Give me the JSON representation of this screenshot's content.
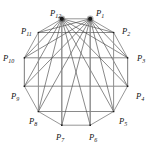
{
  "figure": {
    "shape": "regular dodecagon inscribed in circle",
    "background_color": "#ffffff",
    "edge_color": "#8a8a8a",
    "chord_color": "#4a4a4a",
    "vertex_color": "#1a1a1a",
    "label_color": "#111111"
  },
  "chart_data": {
    "type": "scatter",
    "title": "",
    "xlabel": "",
    "ylabel": "",
    "grid": false,
    "legend": null,
    "geometry": {
      "center_x": 76,
      "center_y": 72,
      "radius": 55,
      "n_vertices": 12,
      "start_angle_deg": -75,
      "angle_step_deg": 30,
      "direction": "clockwise"
    },
    "categories": [
      "P1",
      "P2",
      "P3",
      "P4",
      "P5",
      "P6",
      "P7",
      "P8",
      "P9",
      "P10",
      "P11",
      "P12"
    ],
    "points": [
      {
        "name": "P1",
        "sub": "1",
        "x": 90.2,
        "y": 18.8,
        "label_x": 96,
        "label_y": 16,
        "highlight": true
      },
      {
        "name": "P2",
        "sub": "2",
        "x": 113.6,
        "y": 32.5,
        "label_x": 122,
        "label_y": 34,
        "highlight": false
      },
      {
        "name": "P3",
        "sub": "3",
        "x": 127.6,
        "y": 57.8,
        "label_x": 137,
        "label_y": 61,
        "highlight": false
      },
      {
        "name": "P4",
        "sub": "4",
        "x": 127.6,
        "y": 86.2,
        "label_x": 136,
        "label_y": 99,
        "highlight": false
      },
      {
        "name": "P5",
        "sub": "5",
        "x": 113.6,
        "y": 111.5,
        "label_x": 119,
        "label_y": 124,
        "highlight": false
      },
      {
        "name": "P6",
        "sub": "6",
        "x": 90.2,
        "y": 125.2,
        "label_x": 89,
        "label_y": 140,
        "highlight": false
      },
      {
        "name": "P7",
        "sub": "7",
        "x": 61.8,
        "y": 125.2,
        "label_x": 56,
        "label_y": 140,
        "highlight": false
      },
      {
        "name": "P8",
        "sub": "8",
        "x": 38.4,
        "y": 111.5,
        "label_x": 29,
        "label_y": 124,
        "highlight": false
      },
      {
        "name": "P9",
        "sub": "9",
        "x": 24.4,
        "y": 86.2,
        "label_x": 11,
        "label_y": 99,
        "highlight": false
      },
      {
        "name": "P10",
        "sub": "10",
        "x": 24.4,
        "y": 57.8,
        "label_x": 3,
        "label_y": 61,
        "highlight": false
      },
      {
        "name": "P11",
        "sub": "11",
        "x": 38.4,
        "y": 32.5,
        "label_x": 21,
        "label_y": 34,
        "highlight": false
      },
      {
        "name": "P12",
        "sub": "12",
        "x": 61.8,
        "y": 18.8,
        "label_x": 50,
        "label_y": 16,
        "highlight": true
      }
    ],
    "edges": [
      [
        "P1",
        "P2"
      ],
      [
        "P2",
        "P3"
      ],
      [
        "P3",
        "P4"
      ],
      [
        "P4",
        "P5"
      ],
      [
        "P5",
        "P6"
      ],
      [
        "P6",
        "P7"
      ],
      [
        "P7",
        "P8"
      ],
      [
        "P8",
        "P9"
      ],
      [
        "P9",
        "P10"
      ],
      [
        "P10",
        "P11"
      ],
      [
        "P11",
        "P12"
      ],
      [
        "P12",
        "P1"
      ]
    ],
    "chords": [
      [
        "P1",
        "P3"
      ],
      [
        "P1",
        "P4"
      ],
      [
        "P1",
        "P5"
      ],
      [
        "P1",
        "P6"
      ],
      [
        "P1",
        "P7"
      ],
      [
        "P1",
        "P8"
      ],
      [
        "P1",
        "P9"
      ],
      [
        "P1",
        "P10"
      ],
      [
        "P1",
        "P11"
      ],
      [
        "P12",
        "P2"
      ],
      [
        "P12",
        "P3"
      ],
      [
        "P12",
        "P4"
      ],
      [
        "P12",
        "P5"
      ],
      [
        "P12",
        "P6"
      ],
      [
        "P12",
        "P7"
      ],
      [
        "P12",
        "P8"
      ],
      [
        "P12",
        "P9"
      ],
      [
        "P12",
        "P10"
      ],
      [
        "P2",
        "P11"
      ],
      [
        "P3",
        "P10"
      ],
      [
        "P5",
        "P8"
      ],
      [
        "P4",
        "P9"
      ]
    ],
    "vertical_chords": [
      [
        "P12",
        "P7"
      ],
      [
        "P1",
        "P6"
      ],
      [
        "P11",
        "P8"
      ],
      [
        "P2",
        "P5"
      ],
      [
        "P10",
        "P9"
      ],
      [
        "P3",
        "P4"
      ]
    ],
    "highlighted_vertices": [
      "P1",
      "P12"
    ]
  }
}
